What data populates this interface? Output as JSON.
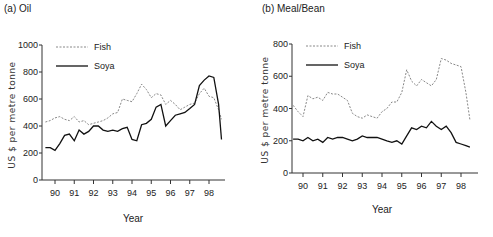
{
  "chart_data": [
    {
      "type": "line",
      "title": "(a) Oil",
      "xlabel": "Year",
      "ylabel": "US $ per metre tonne",
      "ylim": [
        0,
        1000
      ],
      "yticks": [
        0,
        200,
        400,
        600,
        800,
        1000
      ],
      "xticks": [
        "90",
        "91",
        "92",
        "93",
        "94",
        "95",
        "96",
        "97",
        "98"
      ],
      "legend": [
        "Fish",
        "Soya"
      ],
      "legend_position": "top-left",
      "grid": false,
      "x": [
        89.5,
        89.75,
        90.0,
        90.25,
        90.5,
        90.75,
        91.0,
        91.25,
        91.5,
        91.75,
        92.0,
        92.25,
        92.5,
        92.75,
        93.0,
        93.25,
        93.5,
        93.75,
        94.0,
        94.25,
        94.5,
        94.75,
        95.0,
        95.25,
        95.5,
        95.75,
        96.0,
        96.25,
        96.5,
        96.75,
        97.0,
        97.25,
        97.5,
        97.75,
        98.0,
        98.25,
        98.5,
        98.65
      ],
      "series": [
        {
          "name": "Fish",
          "style": "dashed",
          "values": [
            430,
            440,
            460,
            470,
            450,
            440,
            470,
            430,
            440,
            410,
            420,
            430,
            440,
            460,
            490,
            500,
            600,
            590,
            580,
            640,
            710,
            670,
            610,
            640,
            630,
            560,
            590,
            560,
            520,
            540,
            560,
            570,
            640,
            680,
            620,
            610,
            520,
            450
          ]
        },
        {
          "name": "Soya",
          "style": "solid",
          "values": [
            240,
            240,
            220,
            270,
            330,
            340,
            290,
            370,
            340,
            360,
            400,
            400,
            370,
            360,
            370,
            360,
            380,
            390,
            300,
            290,
            410,
            420,
            450,
            540,
            560,
            400,
            440,
            480,
            490,
            500,
            530,
            560,
            700,
            740,
            770,
            760,
            560,
            300
          ]
        }
      ]
    },
    {
      "type": "line",
      "title": "(b) Meal/Bean",
      "xlabel": "Year",
      "ylabel": "US $ per metre tonne",
      "ylim": [
        0,
        800
      ],
      "yticks": [
        0,
        200,
        400,
        600,
        800
      ],
      "xticks": [
        "90",
        "91",
        "92",
        "93",
        "94",
        "95",
        "96",
        "97",
        "98"
      ],
      "legend": [
        "Fish",
        "Soya"
      ],
      "legend_position": "top-left",
      "grid": false,
      "x": [
        89.5,
        89.75,
        90.0,
        90.25,
        90.5,
        90.75,
        91.0,
        91.25,
        91.5,
        91.75,
        92.0,
        92.25,
        92.5,
        92.75,
        93.0,
        93.25,
        93.5,
        93.75,
        94.0,
        94.25,
        94.5,
        94.75,
        95.0,
        95.25,
        95.5,
        95.75,
        96.0,
        96.25,
        96.5,
        96.75,
        97.0,
        97.25,
        97.5,
        97.75,
        98.0,
        98.25,
        98.45
      ],
      "series": [
        {
          "name": "Fish",
          "style": "dashed",
          "values": [
            420,
            380,
            350,
            480,
            460,
            470,
            450,
            500,
            490,
            490,
            470,
            450,
            370,
            350,
            340,
            360,
            350,
            340,
            380,
            400,
            440,
            440,
            500,
            640,
            570,
            540,
            580,
            560,
            540,
            580,
            710,
            700,
            680,
            670,
            660,
            500,
            330
          ]
        },
        {
          "name": "Soya",
          "style": "solid",
          "values": [
            210,
            210,
            200,
            220,
            200,
            210,
            190,
            220,
            210,
            220,
            220,
            210,
            200,
            210,
            230,
            220,
            220,
            220,
            210,
            200,
            190,
            200,
            180,
            230,
            280,
            270,
            290,
            280,
            320,
            290,
            270,
            290,
            250,
            190,
            180,
            170,
            160
          ]
        }
      ]
    }
  ],
  "panels": [
    {
      "title": "(a) Oil",
      "ylabel": "US $ per metre tonne",
      "xlabel": "Year"
    },
    {
      "title": "(b) Meal/Bean",
      "ylabel": "US $ per metre tonne",
      "xlabel": "Year"
    }
  ]
}
